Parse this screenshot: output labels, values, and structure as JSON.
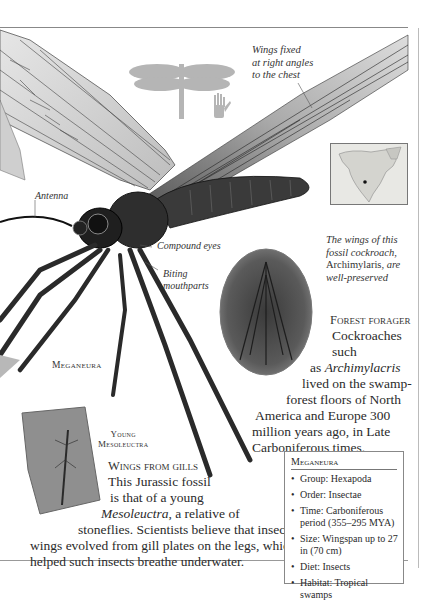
{
  "page": {
    "annotations": {
      "wings": [
        "Wings fixed",
        "at right angles",
        "to the chest"
      ],
      "antenna": "Antenna",
      "compound_eyes": "Compound eyes",
      "mouthparts": [
        "Biting",
        "mouthparts"
      ],
      "cockroach_caption": {
        "line1": "The wings of this",
        "line2": "fossil cockroach,",
        "name": "Archimylaris,",
        "line3_end": " are",
        "line4": "well-preserved"
      },
      "meganeura_label": "Meganeura",
      "mesoleuctra_label": [
        "Young",
        "Mesoleuctra"
      ]
    },
    "forest_forager": {
      "heading": "Forest forager",
      "lines": [
        "Cockroaches such",
        "as ",
        "lived on the swamp-",
        "forest floors of North",
        "America and Europe 300",
        "million years ago, in Late",
        "Carboniferous times."
      ],
      "italic_name": "Archimylacris"
    },
    "wings_from_gills": {
      "heading": "Wings from gills",
      "lines": [
        "This Jurassic fossil",
        "is that of a young",
        ", a relative of",
        "stoneflies. Scientists believe that insect",
        "wings evolved from gill plates on the legs, which",
        "helped such insects breathe underwater."
      ],
      "italic_name": "Mesoleuctra"
    },
    "factbox": {
      "title": "Meganeura",
      "items": [
        "Group: Hexapoda",
        "Order: Insectae",
        "Time: Carboniferous period (355–295 MYA)",
        "Size: Wingspan up to 27 in (70 cm)",
        "Diet: Insects",
        "Habitat: Tropical swamps"
      ]
    },
    "icons": [
      "dragonfly-silhouette-icon",
      "hand-scale-icon",
      "map-location-icon"
    ]
  }
}
